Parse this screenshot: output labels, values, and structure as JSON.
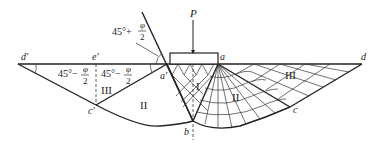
{
  "diagram": {
    "load_label": "P",
    "points": {
      "d_prime": "d'",
      "e_prime": "e'",
      "a_prime": "a'",
      "a": "a",
      "b": "b",
      "c": "c",
      "c_prime": "c'",
      "d": "d"
    },
    "zones": {
      "active": "I",
      "radial_left": "II",
      "radial_right": "II",
      "passive_left": "III",
      "passive_right": "III"
    },
    "angles": {
      "active_angle": {
        "main": "45°+",
        "num": "φ",
        "den": "2"
      },
      "passive_angle_left": {
        "main": "45°−",
        "num": "φ",
        "den": "2"
      },
      "passive_angle_right": {
        "main": "45°−",
        "num": "φ",
        "den": "2"
      }
    },
    "colors": {
      "line": "#222222",
      "background": "#ffffff"
    }
  }
}
